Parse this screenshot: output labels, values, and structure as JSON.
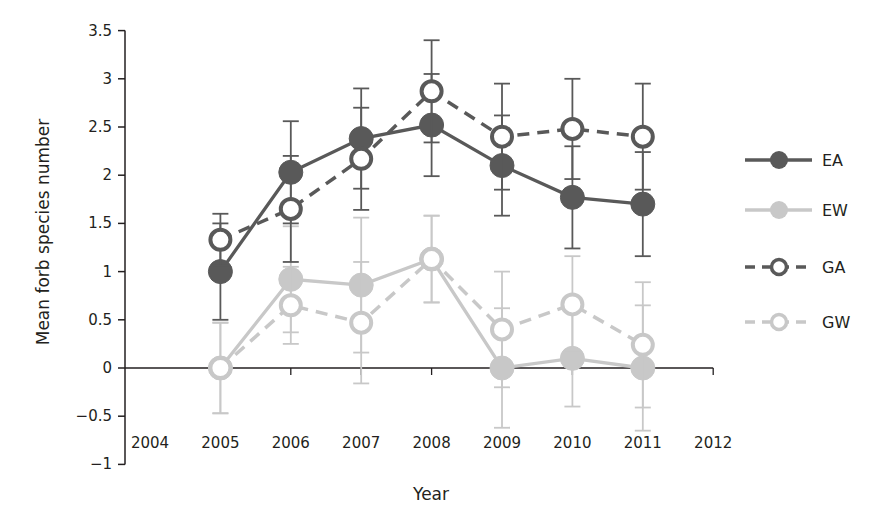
{
  "chart_data": {
    "type": "line",
    "title": "",
    "xlabel": "Year",
    "ylabel": "Mean forb species number",
    "x": [
      2005,
      2006,
      2007,
      2008,
      2009,
      2010,
      2011
    ],
    "x_ticks": [
      "2004",
      "2005",
      "2006",
      "2007",
      "2008",
      "2009",
      "2010",
      "2011",
      "2012"
    ],
    "y_ticks": [
      "3.5",
      "3",
      "2.5",
      "2",
      "1.5",
      "1",
      "0.5",
      "0",
      "−0.5",
      "−1"
    ],
    "xlim": [
      2004,
      2012
    ],
    "ylim": [
      -1,
      3.5
    ],
    "grid": false,
    "legend_position": "right",
    "series": [
      {
        "name": "EA",
        "color": "#595959",
        "marker": "filled-circle",
        "line": "solid",
        "values": [
          1.0,
          2.03,
          2.38,
          2.52,
          2.1,
          1.77,
          1.7
        ],
        "error": [
          0.5,
          0.53,
          0.52,
          0.53,
          0.52,
          0.53,
          0.54
        ]
      },
      {
        "name": "EW",
        "color": "#c8c8c8",
        "marker": "filled-circle",
        "line": "solid",
        "values": [
          0.0,
          0.92,
          0.86,
          1.13,
          0.0,
          0.1,
          0.0
        ],
        "error": [
          0.47,
          0.55,
          0.7,
          0.45,
          0.62,
          0.5,
          0.65
        ]
      },
      {
        "name": "GA",
        "color": "#595959",
        "marker": "open-circle",
        "line": "dashed",
        "values": [
          1.33,
          1.65,
          2.17,
          2.87,
          2.4,
          2.48,
          2.4
        ],
        "error": [
          0.27,
          0.55,
          0.53,
          0.53,
          0.55,
          0.52,
          0.55
        ]
      },
      {
        "name": "GW",
        "color": "#c8c8c8",
        "marker": "open-circle",
        "line": "dashed",
        "values": [
          0.0,
          0.65,
          0.47,
          1.13,
          0.4,
          0.66,
          0.24
        ],
        "error": [
          0.47,
          0.4,
          0.63,
          0.45,
          0.6,
          0.5,
          0.65
        ]
      }
    ]
  }
}
